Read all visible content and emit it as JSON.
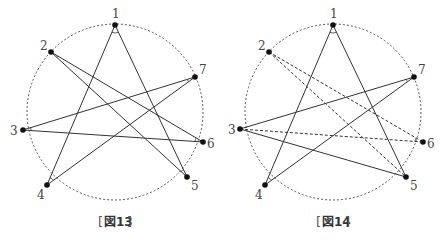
{
  "figures": [
    {
      "id": "fig13",
      "caption": "図13",
      "circle": {
        "cx": 115,
        "cy": 112,
        "r": 88
      },
      "points": [
        {
          "label": "1",
          "x": 115,
          "y": 25,
          "lx": 112,
          "ly": 18
        },
        {
          "label": "2",
          "x": 51,
          "y": 52,
          "lx": 40,
          "ly": 50
        },
        {
          "label": "3",
          "x": 23,
          "y": 130,
          "lx": 10,
          "ly": 135
        },
        {
          "label": "4",
          "x": 47,
          "y": 185,
          "lx": 37,
          "ly": 199
        },
        {
          "label": "5",
          "x": 187,
          "y": 177,
          "lx": 191,
          "ly": 190
        },
        {
          "label": "6",
          "x": 203,
          "y": 142,
          "lx": 207,
          "ly": 148
        },
        {
          "label": "7",
          "x": 195,
          "y": 77,
          "lx": 199,
          "ly": 74
        }
      ],
      "lines": [
        {
          "from": 1,
          "to": 4,
          "style": "solid"
        },
        {
          "from": 1,
          "to": 5,
          "style": "solid"
        },
        {
          "from": 2,
          "to": 5,
          "style": "solid"
        },
        {
          "from": 2,
          "to": 6,
          "style": "solid"
        },
        {
          "from": 3,
          "to": 7,
          "style": "solid"
        },
        {
          "from": 3,
          "to": 6,
          "style": "solid"
        },
        {
          "from": 4,
          "to": 7,
          "style": "solid"
        }
      ]
    },
    {
      "id": "fig14",
      "caption": "図14",
      "circle": {
        "cx": 333,
        "cy": 112,
        "r": 88
      },
      "points": [
        {
          "label": "1",
          "x": 333,
          "y": 25,
          "lx": 330,
          "ly": 18
        },
        {
          "label": "2",
          "x": 269,
          "y": 52,
          "lx": 258,
          "ly": 50
        },
        {
          "label": "3",
          "x": 240,
          "y": 129,
          "lx": 228,
          "ly": 134
        },
        {
          "label": "4",
          "x": 265,
          "y": 185,
          "lx": 255,
          "ly": 199
        },
        {
          "label": "5",
          "x": 406,
          "y": 177,
          "lx": 410,
          "ly": 190
        },
        {
          "label": "6",
          "x": 423,
          "y": 142,
          "lx": 427,
          "ly": 148
        },
        {
          "label": "7",
          "x": 414,
          "y": 77,
          "lx": 418,
          "ly": 74
        }
      ],
      "lines": [
        {
          "from": 1,
          "to": 4,
          "style": "solid"
        },
        {
          "from": 1,
          "to": 5,
          "style": "solid"
        },
        {
          "from": 3,
          "to": 7,
          "style": "solid"
        },
        {
          "from": 3,
          "to": 5,
          "style": "solid"
        },
        {
          "from": 4,
          "to": 7,
          "style": "solid"
        },
        {
          "from": 2,
          "to": 5,
          "style": "dashed"
        },
        {
          "from": 2,
          "to": 6,
          "style": "dashed"
        },
        {
          "from": 3,
          "to": 6,
          "style": "dashed"
        }
      ]
    }
  ],
  "colors": {
    "line": "#333333",
    "point": "#111111",
    "circle": "#555555"
  }
}
